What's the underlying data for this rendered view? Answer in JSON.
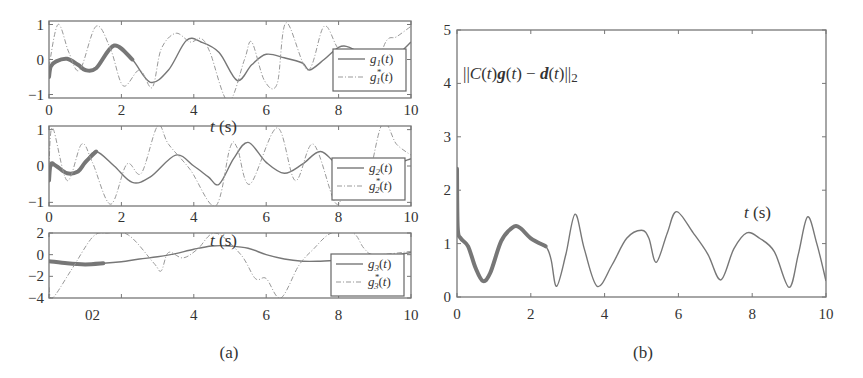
{
  "figure": {
    "captions": {
      "a": "(a)",
      "b": "(b)"
    }
  },
  "chart_data": [
    {
      "id": "a1",
      "type": "line",
      "title": "",
      "xlabel": "t (s)",
      "ylabel": "",
      "xlim": [
        0,
        10
      ],
      "ylim": [
        -1.1,
        1.1
      ],
      "xticks": [
        0,
        2,
        4,
        6,
        8,
        10
      ],
      "xtick_labels": [
        "0",
        "2",
        "4",
        "6",
        "8",
        "10"
      ],
      "yticks": [
        -1,
        0,
        1
      ],
      "ytick_labels": [
        "−1",
        "0",
        "1"
      ],
      "legend": [
        "g1(t)",
        "g1*(t)"
      ],
      "legend_position": "right",
      "series": [
        {
          "name": "g1(t)",
          "style": "solid",
          "x": [
            0,
            0.05,
            0.2,
            0.5,
            0.8,
            1.0,
            1.3,
            1.8,
            2.3,
            2.8,
            3.3,
            3.8,
            4.2,
            4.7,
            5.2,
            5.6,
            6.0,
            6.5,
            7.0,
            7.2,
            7.6,
            8.0,
            8.3,
            8.7,
            9.2,
            9.6,
            10
          ],
          "y": [
            -0.5,
            -0.2,
            -0.05,
            0.02,
            -0.15,
            -0.3,
            -0.25,
            0.4,
            0.0,
            -0.65,
            -0.3,
            0.55,
            0.5,
            0.2,
            -0.6,
            -0.15,
            0.15,
            0.05,
            -0.1,
            -0.3,
            0.0,
            0.35,
            0.35,
            0.1,
            -0.2,
            0.1,
            0.5
          ]
        },
        {
          "name": "g1*(t)",
          "style": "dash-dot",
          "x": [
            0,
            0.25,
            0.55,
            0.85,
            1.3,
            1.7,
            2.05,
            2.5,
            2.85,
            3.1,
            3.5,
            3.9,
            4.2,
            4.45,
            4.95,
            5.4,
            5.6,
            5.95,
            6.3,
            6.55,
            7.15,
            7.6,
            8.0,
            8.5,
            8.9,
            9.3,
            9.6,
            10
          ],
          "y": [
            -0.2,
            1.0,
            0.2,
            -0.3,
            0.95,
            0.3,
            -0.75,
            -0.3,
            -0.8,
            0.3,
            0.75,
            0.5,
            0.6,
            0.2,
            -1.2,
            0.0,
            0.5,
            -0.6,
            -0.7,
            1.05,
            -0.3,
            0.95,
            0.3,
            0.0,
            -0.6,
            0.5,
            0.65,
            0.95
          ]
        }
      ]
    },
    {
      "id": "a2",
      "type": "line",
      "title": "",
      "xlabel": "t (s)",
      "ylabel": "",
      "xlim": [
        0,
        10
      ],
      "ylim": [
        -1.1,
        1.1
      ],
      "xticks": [
        0,
        2,
        4,
        6,
        8,
        10
      ],
      "xtick_labels": [
        "0",
        "2",
        "4",
        "6",
        "8",
        "10"
      ],
      "yticks": [
        -1,
        0,
        1
      ],
      "ytick_labels": [
        "−1",
        "0",
        "1"
      ],
      "legend": [
        "g2(t)",
        "g2*(t)"
      ],
      "legend_position": "right",
      "series": [
        {
          "name": "g2(t)",
          "style": "solid",
          "x": [
            0,
            0.05,
            0.2,
            0.5,
            0.8,
            1.0,
            1.3,
            1.8,
            2.3,
            2.8,
            3.5,
            4.0,
            4.4,
            4.7,
            5.1,
            5.5,
            6.0,
            6.5,
            7.0,
            7.5,
            8.0,
            8.5,
            9.0,
            9.5,
            10
          ],
          "y": [
            -0.4,
            0.05,
            0.0,
            -0.2,
            -0.15,
            0.1,
            0.4,
            0.0,
            -0.45,
            -0.3,
            0.3,
            0.0,
            -0.3,
            -0.5,
            0.2,
            0.65,
            0.1,
            -0.2,
            0.05,
            0.4,
            0.0,
            -0.2,
            -0.4,
            0.0,
            0.2
          ]
        },
        {
          "name": "g2*(t)",
          "style": "dash-dot",
          "x": [
            0,
            0.1,
            0.5,
            0.9,
            1.2,
            1.7,
            2.15,
            2.55,
            3.0,
            3.3,
            3.9,
            4.6,
            5.0,
            5.2,
            5.55,
            6.3,
            6.8,
            7.3,
            7.9,
            8.2,
            8.7,
            9.2,
            9.6,
            10
          ],
          "y": [
            0.0,
            1.05,
            -0.4,
            0.6,
            0.1,
            -1.05,
            0.05,
            -0.2,
            1.1,
            0.6,
            -0.1,
            -1.1,
            0.5,
            0.5,
            -0.5,
            1.05,
            -0.4,
            0.6,
            -1.0,
            -0.7,
            -0.8,
            1.15,
            0.6,
            0.3
          ]
        }
      ]
    },
    {
      "id": "a3",
      "type": "line",
      "title": "",
      "xlabel": "t (s)",
      "ylabel": "",
      "xlim": [
        0,
        10
      ],
      "ylim": [
        -4,
        2
      ],
      "xticks": [
        0,
        2,
        4,
        6,
        8,
        10
      ],
      "xtick_labels": [
        "02",
        "",
        "4",
        "6",
        "8",
        "10"
      ],
      "yticks": [
        -4,
        -2,
        0,
        2
      ],
      "ytick_labels": [
        "−4",
        "−2",
        "0",
        "2"
      ],
      "legend": [
        "g3(t)",
        "g3*(t)"
      ],
      "legend_position": "right",
      "series": [
        {
          "name": "g3(t)",
          "style": "solid",
          "x": [
            0,
            0.5,
            1.0,
            1.5,
            2.0,
            2.5,
            3.0,
            3.5,
            4.0,
            4.5,
            5.0,
            5.5,
            6.0,
            6.5,
            7.0,
            7.5,
            8.0,
            9.0,
            10
          ],
          "y": [
            -0.6,
            -0.8,
            -0.9,
            -0.8,
            -0.65,
            -0.4,
            -0.2,
            0.1,
            0.5,
            0.8,
            0.8,
            0.6,
            0.0,
            -0.4,
            -0.6,
            -0.6,
            -0.5,
            -0.3,
            0.2
          ]
        },
        {
          "name": "g3*(t)",
          "style": "dashed",
          "x": [
            0,
            0.1,
            0.6,
            1.2,
            1.6,
            2.2,
            2.9,
            3.1,
            3.3,
            3.7,
            4.1,
            4.6,
            5.3,
            5.7,
            6.0,
            6.4,
            6.9,
            7.3,
            7.8,
            8.4,
            8.7,
            9.0,
            10
          ],
          "y": [
            -3.0,
            -4.0,
            -1.5,
            1.6,
            2.0,
            1.8,
            -0.8,
            -1.5,
            0.2,
            -0.3,
            0.5,
            2.0,
            0.0,
            -2.2,
            -2.2,
            -4.0,
            -1.0,
            0.5,
            2.0,
            2.0,
            0.6,
            0.0,
            0.3
          ]
        }
      ]
    },
    {
      "id": "b",
      "type": "line",
      "title": "||C(t)g(t) − d(t)||2",
      "xlabel": "t (s)",
      "ylabel": "",
      "xlim": [
        0,
        10
      ],
      "ylim": [
        0,
        5
      ],
      "xticks": [
        0,
        2,
        4,
        6,
        8,
        10
      ],
      "xtick_labels": [
        "0",
        "2",
        "4",
        "6",
        "8",
        "10"
      ],
      "yticks": [
        0,
        1,
        2,
        3,
        4,
        5
      ],
      "ytick_labels": [
        "0",
        "1",
        "2",
        "3",
        "4",
        "5"
      ],
      "grid": false,
      "series": [
        {
          "name": "||C(t)g(t) − d(t)||2",
          "style": "solid",
          "x": [
            0,
            0.02,
            0.1,
            0.3,
            0.5,
            0.7,
            0.9,
            1.2,
            1.5,
            1.7,
            2.0,
            2.4,
            2.55,
            2.7,
            2.95,
            3.2,
            3.45,
            3.8,
            4.2,
            4.6,
            5.0,
            5.2,
            5.4,
            5.7,
            5.95,
            6.4,
            6.8,
            7.15,
            7.5,
            7.85,
            8.2,
            8.6,
            9.0,
            9.25,
            9.5,
            9.75,
            10
          ],
          "y": [
            2.4,
            1.3,
            1.1,
            0.95,
            0.55,
            0.3,
            0.45,
            1.05,
            1.3,
            1.3,
            1.1,
            0.95,
            0.7,
            0.2,
            0.8,
            1.55,
            0.9,
            0.2,
            0.6,
            1.1,
            1.25,
            1.1,
            0.65,
            1.2,
            1.6,
            1.2,
            0.8,
            0.32,
            0.9,
            1.2,
            1.1,
            0.85,
            0.18,
            0.8,
            1.5,
            1.0,
            0.3
          ]
        }
      ]
    }
  ],
  "panels": {
    "a1": {
      "xlabel": "t (s)",
      "legend": {
        "line1": "g",
        "sub1": "1",
        "arg1": "(t)",
        "line2": "g",
        "sub2": "1",
        "sup2": "*",
        "arg2": "(t)"
      }
    },
    "a2": {
      "xlabel": "t (s)",
      "legend": {
        "line1": "g",
        "sub1": "2",
        "arg1": "(t)",
        "line2": "g",
        "sub2": "2",
        "sup2": "*",
        "arg2": "(t)"
      }
    },
    "a3": {
      "xlabel": "t (s)",
      "legend": {
        "line1": "g",
        "sub1": "3",
        "arg1": "(t)",
        "line2": "g",
        "sub2": "3",
        "sup2": "*",
        "arg2": "(t)"
      }
    },
    "b": {
      "xlabel": "t (s)",
      "annotation": "||C(t)g(t) − d(t)||",
      "annotation_sub": "2"
    }
  },
  "colors": {
    "line": "#777777",
    "dashed": "#999999",
    "frame": "#777777",
    "text": "#333333"
  }
}
